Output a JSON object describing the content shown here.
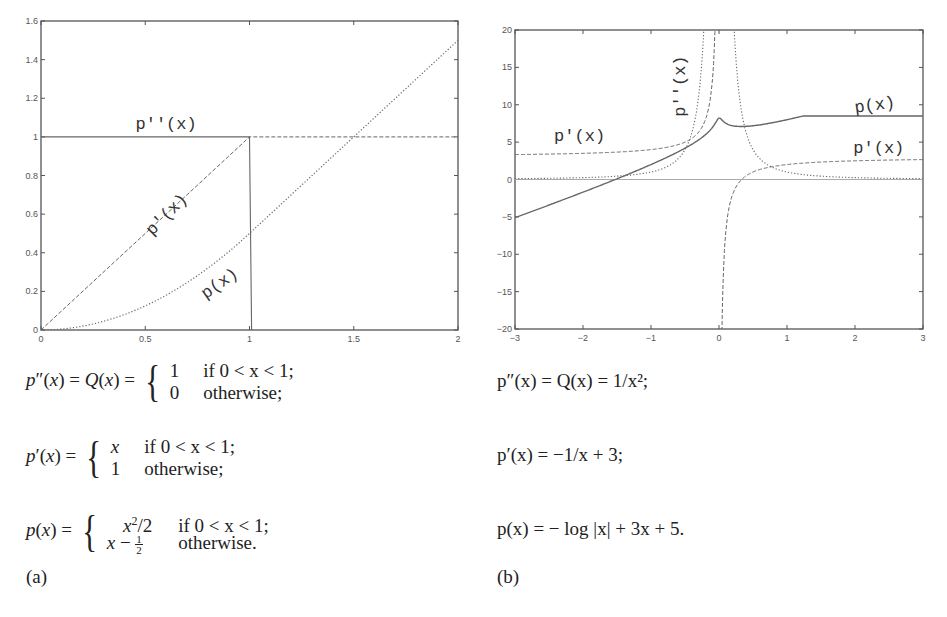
{
  "panels": [
    {
      "id": "a",
      "caption": "(a)",
      "equations": {
        "second": {
          "lhs": "p″(x) = Q(x) =",
          "cases": [
            [
              "1",
              "if 0 < x < 1;"
            ],
            [
              "0",
              "otherwise;"
            ]
          ]
        },
        "first": {
          "lhs": "p′(x) =",
          "cases": [
            [
              "x",
              "if 0 < x < 1;"
            ],
            [
              "1",
              "otherwise;"
            ]
          ]
        },
        "primitive": {
          "lhs": "p(x) =",
          "cases": [
            [
              "x²/2",
              "if 0 < x < 1;"
            ],
            [
              "x − ½",
              "otherwise."
            ]
          ]
        }
      }
    },
    {
      "id": "b",
      "caption": "(b)",
      "equations": {
        "second": "p″(x) = Q(x) = 1/x²;",
        "first": "p′(x) = −1/x + 3;",
        "primitive": "p(x) = − log |x| + 3x + 5."
      }
    }
  ],
  "chart_data": [
    {
      "type": "line",
      "panel": "a",
      "xlim": [
        0,
        2
      ],
      "ylim": [
        0,
        1.6
      ],
      "xticks": [
        "0",
        "0.5",
        "1",
        "1.5",
        "2"
      ],
      "yticks": [
        "0",
        "0.2",
        "0.4",
        "0.6",
        "0.8",
        "1",
        "1.2",
        "1.4",
        "1.6"
      ],
      "grid": false,
      "series": [
        {
          "name": "p''(x)",
          "style": "solid",
          "x": [
            0,
            1,
            1,
            1.0,
            2
          ],
          "y": [
            1,
            1,
            0,
            1,
            1
          ],
          "note": "Q(x)=1 on (0,1), drops vertically at x=1; dashed continuation y=1 for x>1 belongs to p'(x)"
        },
        {
          "name": "p'(x)",
          "style": "dashed",
          "x": [
            0,
            0.25,
            0.5,
            0.75,
            1,
            1.5,
            2
          ],
          "y": [
            0,
            0.25,
            0.5,
            0.75,
            1,
            1,
            1
          ]
        },
        {
          "name": "p(x)",
          "style": "dotted",
          "x": [
            0,
            0.25,
            0.5,
            0.75,
            1,
            1.5,
            2
          ],
          "y": [
            0,
            0.03125,
            0.125,
            0.28125,
            0.5,
            1.0,
            1.5
          ]
        }
      ],
      "labels": [
        {
          "text": "p''(x)",
          "x": 0.6,
          "y": 1.04,
          "rotation": 0
        },
        {
          "text": "p'(x)",
          "x": 0.62,
          "y": 0.58,
          "rotation": -45
        },
        {
          "text": "p(x)",
          "x": 0.87,
          "y": 0.22,
          "rotation": -35
        }
      ]
    },
    {
      "type": "line",
      "panel": "b",
      "xlim": [
        -3,
        3
      ],
      "ylim": [
        -20,
        20
      ],
      "xticks": [
        "−3",
        "−2",
        "−1",
        "0",
        "1",
        "2",
        "3"
      ],
      "yticks": [
        "−20",
        "−15",
        "−10",
        "−5",
        "0",
        "5",
        "10",
        "15",
        "20"
      ],
      "grid": false,
      "series": [
        {
          "name": "p(x)",
          "style": "solid",
          "formula": "-log|x|+3x+5 (smoothed near 0, peak ≈ 8.5)",
          "x": [
            -3,
            -2,
            -1.5,
            -1,
            -0.5,
            -0.2,
            0,
            0.2,
            0.4,
            1,
            2,
            3
          ],
          "y": [
            -5.1,
            -1.7,
            0.1,
            2.0,
            4.2,
            6.4,
            8.5,
            7.3,
            7.0,
            8.0,
            10.3,
            12.8
          ]
        },
        {
          "name": "p'(x)",
          "style": "dashed",
          "formula": "-1/x+3",
          "x": [
            -3,
            -2,
            -1,
            -0.5,
            -0.2,
            -0.06,
            0.06,
            0.2,
            0.5,
            1,
            2,
            3
          ],
          "y": [
            3.33,
            3.5,
            4.0,
            5.0,
            8.0,
            19.7,
            -13.7,
            -2.0,
            1.0,
            2.0,
            2.5,
            2.67
          ]
        },
        {
          "name": "p''(x)",
          "style": "dotted",
          "formula": "1/x^2",
          "x": [
            -3,
            -2,
            -1,
            -0.5,
            -0.3,
            -0.22,
            0.22,
            0.3,
            0.5,
            1,
            2,
            3
          ],
          "y": [
            0.11,
            0.25,
            1.0,
            4.0,
            11.1,
            20.0,
            20.0,
            11.1,
            4.0,
            1.0,
            0.25,
            0.11
          ]
        }
      ],
      "labels": [
        {
          "text": "p'(x)",
          "x": -2.05,
          "y": 5.2,
          "rotation": 0
        },
        {
          "text": "p''(x)",
          "x": -0.5,
          "y": 12.5,
          "rotation": -90
        },
        {
          "text": "p(x)",
          "x": 2.3,
          "y": 9.3,
          "rotation": -8
        },
        {
          "text": "p'(x)",
          "x": 2.35,
          "y": 3.5,
          "rotation": 0
        }
      ]
    }
  ]
}
